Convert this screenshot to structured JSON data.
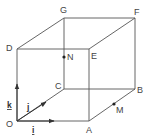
{
  "diagram": {
    "vertices": {
      "O": {
        "label": "O"
      },
      "A": {
        "label": "A"
      },
      "B": {
        "label": "B"
      },
      "C": {
        "label": "C"
      },
      "D": {
        "label": "D"
      },
      "E": {
        "label": "E"
      },
      "F": {
        "label": "F"
      },
      "G": {
        "label": "G"
      }
    },
    "points": {
      "M": {
        "label": "M"
      },
      "N": {
        "label": "N"
      }
    },
    "vectors": {
      "i": {
        "label": "i"
      },
      "j": {
        "label": "j"
      },
      "k": {
        "label": "k"
      }
    }
  }
}
